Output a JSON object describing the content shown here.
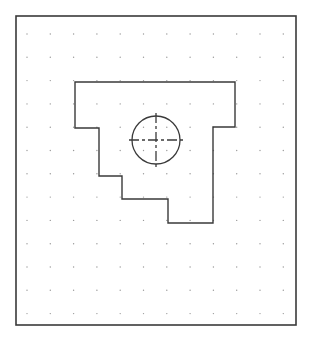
{
  "drawing": {
    "background": "#ffffff",
    "frame": {
      "x": 16,
      "y": 16,
      "width": 280,
      "height": 309,
      "stroke": "#3a3a3a",
      "stroke_width": 1.6
    },
    "grid": {
      "origin_x": 27,
      "origin_y": 34,
      "spacing": 23.3,
      "columns": 12,
      "rows": 13,
      "dot_color": "#9a9a9a",
      "dot_radius": 0.7
    },
    "part_outline": {
      "stroke": "#3a3a3a",
      "stroke_width": 1.4,
      "points": [
        [
          75,
          82
        ],
        [
          235,
          82
        ],
        [
          235,
          127
        ],
        [
          213,
          127
        ],
        [
          213,
          223
        ],
        [
          168,
          223
        ],
        [
          168,
          199
        ],
        [
          122,
          199
        ],
        [
          122,
          176
        ],
        [
          99,
          176
        ],
        [
          99,
          128
        ],
        [
          75,
          128
        ]
      ]
    },
    "hole": {
      "cx": 156,
      "cy": 140,
      "r": 24,
      "stroke": "#3a3a3a",
      "stroke_width": 1.3,
      "centerline_extent": 27,
      "centerline_dash": "10 3 3 3"
    }
  }
}
